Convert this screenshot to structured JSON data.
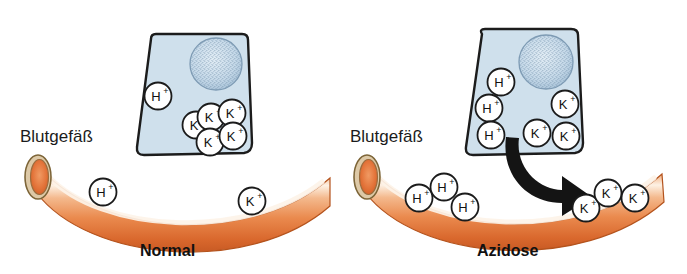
{
  "figure": {
    "background_color": "#ffffff",
    "width": 687,
    "height": 274,
    "title": ""
  },
  "colors": {
    "cell_fill": "#cfe0ec",
    "cell_stroke": "#1c1c1c",
    "nucleus_fill": "#c3d6e6",
    "nucleus_speckle": "#6d8ba6",
    "vessel_orange_light": "#f6c9a6",
    "vessel_orange_mid": "#ea8a4e",
    "vessel_orange_dark": "#d1622c",
    "vessel_highlight": "#fdf0e2",
    "vessel_wall": "#ddc9a7",
    "vessel_wall_stroke": "#8a7040",
    "vessel_lumen": "#e0703a",
    "arrow_fill": "#141414",
    "ion_circle_fill": "#ffffff",
    "ion_circle_stroke": "#1b1b1b",
    "text_color": "#1b1b1b"
  },
  "panels": [
    {
      "id": "normal",
      "caption": "Normal",
      "vessel_label": "Blutgefäß",
      "cell": {
        "name": "epithelial-cell",
        "nucleus": true,
        "ions": [
          {
            "species": "H",
            "charge": "+",
            "cx": 158,
            "cy": 96
          },
          {
            "species": "K",
            "charge": "+",
            "cx": 196,
            "cy": 125
          },
          {
            "species": "K",
            "charge": "+",
            "cx": 211,
            "cy": 117
          },
          {
            "species": "K",
            "charge": "+",
            "cx": 232,
            "cy": 113
          },
          {
            "species": "K",
            "charge": "+",
            "cx": 210,
            "cy": 142
          },
          {
            "species": "K",
            "charge": "+",
            "cx": 233,
            "cy": 136
          }
        ]
      },
      "vessel": {
        "name": "blood-vessel",
        "ions": [
          {
            "species": "H",
            "charge": "+",
            "cx": 103,
            "cy": 192
          },
          {
            "species": "K",
            "charge": "+",
            "cx": 252,
            "cy": 201
          }
        ]
      },
      "arrow": null
    },
    {
      "id": "azidose",
      "caption": "Azidose",
      "vessel_label": "Blutgefäß",
      "cell": {
        "name": "epithelial-cell",
        "nucleus": true,
        "ions": [
          {
            "species": "H",
            "charge": "+",
            "cx": 501,
            "cy": 82
          },
          {
            "species": "H",
            "charge": "+",
            "cx": 489,
            "cy": 108
          },
          {
            "species": "H",
            "charge": "+",
            "cx": 491,
            "cy": 135
          },
          {
            "species": "K",
            "charge": "+",
            "cx": 565,
            "cy": 104
          },
          {
            "species": "K",
            "charge": "+",
            "cx": 537,
            "cy": 133
          },
          {
            "species": "K",
            "charge": "+",
            "cx": 566,
            "cy": 136
          }
        ]
      },
      "vessel": {
        "name": "blood-vessel",
        "ions": [
          {
            "species": "H",
            "charge": "+",
            "cx": 419,
            "cy": 198
          },
          {
            "species": "H",
            "charge": "+",
            "cx": 444,
            "cy": 187
          },
          {
            "species": "H",
            "charge": "+",
            "cx": 465,
            "cy": 207
          },
          {
            "species": "K",
            "charge": "+",
            "cx": 586,
            "cy": 208
          },
          {
            "species": "K",
            "charge": "+",
            "cx": 608,
            "cy": 193
          },
          {
            "species": "K",
            "charge": "+",
            "cx": 635,
            "cy": 198
          }
        ]
      },
      "arrow": {
        "name": "potassium-efflux-arrow",
        "description": "curved black arrow from cell into blood vessel"
      }
    }
  ],
  "legend": {
    "hydrogen_symbol": "H",
    "potassium_symbol": "K",
    "charge_symbol": "+"
  }
}
